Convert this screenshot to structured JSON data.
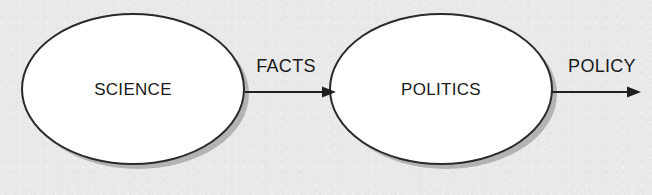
{
  "diagram": {
    "type": "flow-diagram",
    "background_color": "#e9e9e9",
    "nodes": [
      {
        "id": "science",
        "label": "SCIENCE",
        "shape": "ellipse",
        "cx": 133,
        "cy": 89,
        "rx": 111,
        "ry": 75,
        "fill_color": "#ffffff",
        "stroke_color": "#2a2a2a",
        "shadow_color": "#a9a9a9"
      },
      {
        "id": "politics",
        "label": "POLITICS",
        "shape": "ellipse",
        "cx": 441,
        "cy": 89,
        "rx": 111,
        "ry": 75,
        "fill_color": "#ffffff",
        "stroke_color": "#2a2a2a",
        "shadow_color": "#a9a9a9"
      }
    ],
    "edges": [
      {
        "id": "facts",
        "label": "FACTS",
        "from": "science",
        "to": "politics",
        "x1": 245,
        "x2": 336,
        "y": 92,
        "label_x": 286,
        "label_y": 72,
        "stroke_color": "#1f1f1f"
      },
      {
        "id": "policy",
        "label": "POLICY",
        "from": "politics",
        "to": "",
        "x1": 552,
        "x2": 641,
        "y": 92,
        "label_x": 602,
        "label_y": 72,
        "stroke_color": "#1f1f1f"
      }
    ]
  }
}
